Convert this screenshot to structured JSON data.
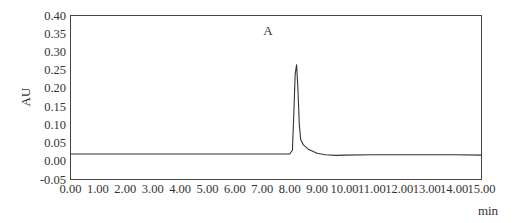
{
  "chart_data": {
    "type": "line",
    "title": "",
    "annotation": "A",
    "xlabel": "min",
    "ylabel": "AU",
    "xlim": [
      0,
      15
    ],
    "ylim": [
      -0.05,
      0.4
    ],
    "grid": false,
    "legend": null,
    "x_ticks": [
      "0.00",
      "1.00",
      "2.00",
      "3.00",
      "4.00",
      "5.00",
      "6.00",
      "7.00",
      "8.00",
      "9.00",
      "10.00",
      "11.00",
      "12.00",
      "13.00",
      "14.00",
      "15.00"
    ],
    "y_ticks": [
      "0.40",
      "0.35",
      "0.30",
      "0.25",
      "0.20",
      "0.15",
      "0.10",
      "0.05",
      "0.00",
      "-0.05"
    ],
    "series": [
      {
        "name": "chromatogram",
        "color": "#333333",
        "x": [
          0.0,
          2.0,
          4.0,
          6.0,
          7.5,
          8.0,
          8.1,
          8.15,
          8.2,
          8.25,
          8.3,
          8.35,
          8.4,
          8.5,
          8.7,
          9.0,
          9.3,
          9.7,
          10.0,
          11.0,
          12.0,
          13.0,
          14.0,
          15.0
        ],
        "y": [
          0.02,
          0.02,
          0.02,
          0.02,
          0.02,
          0.02,
          0.03,
          0.13,
          0.24,
          0.265,
          0.2,
          0.1,
          0.06,
          0.045,
          0.032,
          0.022,
          0.018,
          0.016,
          0.017,
          0.018,
          0.018,
          0.018,
          0.018,
          0.017
        ]
      }
    ],
    "peak": {
      "retention_time_min": 8.25,
      "height_au": 0.265
    }
  }
}
